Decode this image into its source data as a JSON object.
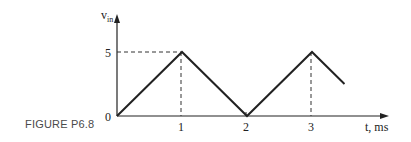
{
  "figure": {
    "caption": "FIGURE P6.8"
  },
  "chart_data": {
    "type": "line",
    "title": "",
    "caption": "FIGURE P6.8",
    "xlabel": "t, ms",
    "ylabel": "v_in",
    "ylabel_main": "v",
    "ylabel_sub": "in",
    "x_ticks": [
      "1",
      "2",
      "3"
    ],
    "y_ticks": [
      "0",
      "5"
    ],
    "origin_label": "0",
    "xlim": [
      0,
      4.2
    ],
    "ylim": [
      0,
      6
    ],
    "grid": false,
    "legend": null,
    "series": [
      {
        "name": "v_in (triangle wave)",
        "x": [
          0,
          1,
          2,
          3,
          3.5
        ],
        "y": [
          0,
          5,
          0,
          5,
          2.5
        ]
      }
    ],
    "annotations": [
      {
        "type": "dashed-guide",
        "description": "horizontal dashed line from y-axis at v=5 to peak at t=1"
      },
      {
        "type": "dashed-guide",
        "description": "vertical dashed line from peak at t=1 down to t-axis"
      },
      {
        "type": "dashed-guide",
        "description": "vertical dashed line from peak at t=3 down to t-axis"
      }
    ]
  }
}
